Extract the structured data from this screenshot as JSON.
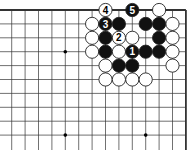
{
  "diagram": {
    "type": "go-board-fragment",
    "grid": {
      "cols": 14,
      "rows": 10,
      "origin_x": 11.7,
      "origin_y": 10,
      "dx": 13.4,
      "dy": 13.9,
      "top_edge": true,
      "right_edge": true,
      "left_edge": false,
      "bottom_edge": false
    },
    "colors": {
      "background": "#ffffff",
      "line": "#333333",
      "black_stone": "#111111",
      "white_stone": "#ffffff",
      "stone_outline": "#222222"
    },
    "star_points": [
      {
        "col": 4,
        "row": 3
      },
      {
        "col": 4,
        "row": 9
      },
      {
        "col": 10,
        "row": 9
      }
    ],
    "stones": [
      {
        "col": 7,
        "row": 0,
        "color": "white",
        "label": "4"
      },
      {
        "col": 9,
        "row": 0,
        "color": "black",
        "label": "5"
      },
      {
        "col": 11,
        "row": 0,
        "color": "white",
        "label": ""
      },
      {
        "col": 6,
        "row": 1,
        "color": "white",
        "label": ""
      },
      {
        "col": 7,
        "row": 1,
        "color": "black",
        "label": "3"
      },
      {
        "col": 8,
        "row": 1,
        "color": "black",
        "label": ""
      },
      {
        "col": 10,
        "row": 1,
        "color": "black",
        "label": ""
      },
      {
        "col": 11,
        "row": 1,
        "color": "black",
        "label": ""
      },
      {
        "col": 12,
        "row": 1,
        "color": "white",
        "label": ""
      },
      {
        "col": 6,
        "row": 2,
        "color": "white",
        "label": ""
      },
      {
        "col": 7,
        "row": 2,
        "color": "black",
        "label": ""
      },
      {
        "col": 8,
        "row": 2,
        "color": "white",
        "label": "2"
      },
      {
        "col": 9,
        "row": 2,
        "color": "white",
        "label": ""
      },
      {
        "col": 11,
        "row": 2,
        "color": "black",
        "label": ""
      },
      {
        "col": 12,
        "row": 2,
        "color": "white",
        "label": ""
      },
      {
        "col": 6,
        "row": 3,
        "color": "white",
        "label": ""
      },
      {
        "col": 7,
        "row": 3,
        "color": "black",
        "label": ""
      },
      {
        "col": 8,
        "row": 3,
        "color": "white",
        "label": ""
      },
      {
        "col": 9,
        "row": 3,
        "color": "black",
        "label": "1"
      },
      {
        "col": 10,
        "row": 3,
        "color": "black",
        "label": ""
      },
      {
        "col": 11,
        "row": 3,
        "color": "black",
        "label": ""
      },
      {
        "col": 12,
        "row": 3,
        "color": "white",
        "label": ""
      },
      {
        "col": 7,
        "row": 4,
        "color": "white",
        "label": ""
      },
      {
        "col": 8,
        "row": 4,
        "color": "black",
        "label": ""
      },
      {
        "col": 9,
        "row": 4,
        "color": "black",
        "label": ""
      },
      {
        "col": 12,
        "row": 4,
        "color": "white",
        "label": ""
      },
      {
        "col": 7,
        "row": 5,
        "color": "white",
        "label": ""
      },
      {
        "col": 8,
        "row": 5,
        "color": "white",
        "label": ""
      },
      {
        "col": 9,
        "row": 5,
        "color": "white",
        "label": ""
      },
      {
        "col": 10,
        "row": 5,
        "color": "white",
        "label": ""
      }
    ]
  }
}
